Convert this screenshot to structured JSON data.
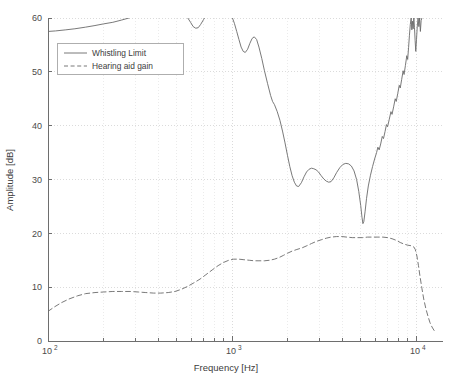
{
  "chart_data": {
    "type": "line",
    "title": "",
    "xlabel": "Frequency [Hz]",
    "ylabel": "Amplitude [dB]",
    "xscale": "log",
    "yscale": "linear",
    "xlim": [
      100,
      14000
    ],
    "ylim": [
      0,
      60
    ],
    "grid": true,
    "legend_position": "upper-left",
    "xticks": [
      100,
      1000,
      10000
    ],
    "xtick_labels": [
      "10^2",
      "10^3",
      "10^4"
    ],
    "xtick_mantissa": [
      "10",
      "10",
      "10"
    ],
    "xtick_exponent": [
      "2",
      "3",
      "4"
    ],
    "yticks": [
      0,
      10,
      20,
      30,
      40,
      50,
      60
    ],
    "ytick_labels": [
      "0",
      "10",
      "20",
      "30",
      "40",
      "50",
      "60"
    ],
    "series": [
      {
        "name": "Whistling Limit",
        "style": "solid",
        "color": "#6a6a6a",
        "points": [
          [
            100,
            57.5
          ],
          [
            110,
            57.6
          ],
          [
            125,
            57.8
          ],
          [
            140,
            58.0
          ],
          [
            160,
            58.3
          ],
          [
            180,
            58.6
          ],
          [
            200,
            58.9
          ],
          [
            225,
            59.2
          ],
          [
            250,
            59.6
          ],
          [
            275,
            60.0
          ],
          [
            300,
            60.6
          ],
          [
            340,
            61.5
          ],
          [
            380,
            62.3
          ],
          [
            420,
            62.8
          ],
          [
            460,
            62.9
          ],
          [
            500,
            62.4
          ],
          [
            540,
            61.2
          ],
          [
            570,
            60.2
          ],
          [
            595,
            59.2
          ],
          [
            615,
            58.4
          ],
          [
            635,
            58.1
          ],
          [
            655,
            58.2
          ],
          [
            675,
            58.8
          ],
          [
            700,
            59.7
          ],
          [
            730,
            60.8
          ],
          [
            780,
            62.2
          ],
          [
            840,
            63.0
          ],
          [
            900,
            62.6
          ],
          [
            950,
            61.4
          ],
          [
            1000,
            60.2
          ],
          [
            1030,
            59.0
          ],
          [
            1060,
            57.5
          ],
          [
            1090,
            56.0
          ],
          [
            1120,
            54.6
          ],
          [
            1150,
            53.8
          ],
          [
            1180,
            53.6
          ],
          [
            1215,
            54.2
          ],
          [
            1250,
            55.3
          ],
          [
            1285,
            56.2
          ],
          [
            1320,
            56.5
          ],
          [
            1360,
            56.0
          ],
          [
            1400,
            54.6
          ],
          [
            1450,
            52.5
          ],
          [
            1500,
            50.2
          ],
          [
            1560,
            47.8
          ],
          [
            1620,
            45.6
          ],
          [
            1660,
            44.5
          ],
          [
            1700,
            43.9
          ],
          [
            1760,
            42.6
          ],
          [
            1820,
            41.0
          ],
          [
            1880,
            39.0
          ],
          [
            1940,
            36.8
          ],
          [
            2000,
            34.5
          ],
          [
            2060,
            32.4
          ],
          [
            2120,
            30.7
          ],
          [
            2180,
            29.5
          ],
          [
            2240,
            28.8
          ],
          [
            2300,
            28.7
          ],
          [
            2380,
            29.4
          ],
          [
            2460,
            30.5
          ],
          [
            2540,
            31.4
          ],
          [
            2620,
            31.9
          ],
          [
            2700,
            32.1
          ],
          [
            2780,
            32.0
          ],
          [
            2860,
            31.8
          ],
          [
            2950,
            31.4
          ],
          [
            3050,
            30.7
          ],
          [
            3150,
            30.1
          ],
          [
            3250,
            29.7
          ],
          [
            3350,
            29.5
          ],
          [
            3450,
            29.6
          ],
          [
            3570,
            30.3
          ],
          [
            3700,
            31.3
          ],
          [
            3850,
            32.2
          ],
          [
            4000,
            32.8
          ],
          [
            4150,
            33.0
          ],
          [
            4300,
            32.9
          ],
          [
            4450,
            32.5
          ],
          [
            4600,
            31.6
          ],
          [
            4750,
            30.0
          ],
          [
            4880,
            27.8
          ],
          [
            5000,
            25.2
          ],
          [
            5080,
            23.0
          ],
          [
            5140,
            21.8
          ],
          [
            5200,
            22.2
          ],
          [
            5280,
            24.0
          ],
          [
            5380,
            26.5
          ],
          [
            5500,
            28.8
          ],
          [
            5650,
            30.8
          ],
          [
            5800,
            32.4
          ],
          [
            5950,
            33.8
          ],
          [
            6100,
            35.0
          ],
          [
            6200,
            36.0
          ],
          [
            6300,
            35.5
          ],
          [
            6420,
            36.6
          ],
          [
            6550,
            38.0
          ],
          [
            6650,
            37.6
          ],
          [
            6780,
            38.9
          ],
          [
            6900,
            40.2
          ],
          [
            7000,
            39.8
          ],
          [
            7150,
            41.2
          ],
          [
            7300,
            42.6
          ],
          [
            7400,
            42.1
          ],
          [
            7550,
            43.5
          ],
          [
            7700,
            45.0
          ],
          [
            7800,
            44.5
          ],
          [
            7950,
            46.0
          ],
          [
            8100,
            47.5
          ],
          [
            8200,
            47.0
          ],
          [
            8350,
            48.6
          ],
          [
            8500,
            50.2
          ],
          [
            8600,
            49.5
          ],
          [
            8750,
            51.2
          ],
          [
            8900,
            53.0
          ],
          [
            9000,
            52.3
          ],
          [
            9100,
            54.5
          ],
          [
            9200,
            56.8
          ],
          [
            9300,
            58.8
          ],
          [
            9400,
            60.0
          ],
          [
            9480,
            57.8
          ],
          [
            9560,
            59.4
          ],
          [
            9640,
            58.0
          ],
          [
            9720,
            60.0
          ],
          [
            9800,
            58.2
          ],
          [
            9880,
            55.8
          ],
          [
            9960,
            53.8
          ],
          [
            10050,
            56.0
          ],
          [
            10150,
            58.5
          ],
          [
            10250,
            60.0
          ],
          [
            10350,
            58.4
          ],
          [
            10450,
            60.0
          ],
          [
            10550,
            57.5
          ],
          [
            10650,
            59.5
          ],
          [
            10750,
            60.0
          ]
        ]
      },
      {
        "name": "Hearing aid gain",
        "style": "dashed",
        "color": "#8a8a8a",
        "points": [
          [
            100,
            5.5
          ],
          [
            108,
            6.3
          ],
          [
            118,
            7.1
          ],
          [
            130,
            7.8
          ],
          [
            145,
            8.4
          ],
          [
            160,
            8.8
          ],
          [
            180,
            9.0
          ],
          [
            200,
            9.1
          ],
          [
            225,
            9.2
          ],
          [
            250,
            9.2
          ],
          [
            280,
            9.2
          ],
          [
            310,
            9.1
          ],
          [
            340,
            9.0
          ],
          [
            375,
            8.9
          ],
          [
            410,
            8.9
          ],
          [
            450,
            9.0
          ],
          [
            490,
            9.2
          ],
          [
            530,
            9.6
          ],
          [
            570,
            10.1
          ],
          [
            620,
            10.8
          ],
          [
            670,
            11.5
          ],
          [
            720,
            12.3
          ],
          [
            780,
            13.2
          ],
          [
            840,
            14.0
          ],
          [
            900,
            14.6
          ],
          [
            960,
            15.0
          ],
          [
            1020,
            15.2
          ],
          [
            1090,
            15.2
          ],
          [
            1160,
            15.1
          ],
          [
            1240,
            15.0
          ],
          [
            1320,
            14.9
          ],
          [
            1400,
            14.9
          ],
          [
            1500,
            14.9
          ],
          [
            1600,
            15.0
          ],
          [
            1700,
            15.2
          ],
          [
            1800,
            15.5
          ],
          [
            1900,
            15.9
          ],
          [
            2000,
            16.3
          ],
          [
            2120,
            16.7
          ],
          [
            2250,
            17.0
          ],
          [
            2400,
            17.3
          ],
          [
            2550,
            17.7
          ],
          [
            2700,
            18.1
          ],
          [
            2870,
            18.5
          ],
          [
            3050,
            18.8
          ],
          [
            3250,
            19.1
          ],
          [
            3450,
            19.3
          ],
          [
            3700,
            19.4
          ],
          [
            3950,
            19.4
          ],
          [
            4200,
            19.3
          ],
          [
            4500,
            19.2
          ],
          [
            4800,
            19.2
          ],
          [
            5100,
            19.2
          ],
          [
            5450,
            19.3
          ],
          [
            5800,
            19.3
          ],
          [
            6200,
            19.3
          ],
          [
            6600,
            19.3
          ],
          [
            7000,
            19.2
          ],
          [
            7400,
            19.0
          ],
          [
            7800,
            18.7
          ],
          [
            8200,
            18.3
          ],
          [
            8600,
            18.0
          ],
          [
            9000,
            17.8
          ],
          [
            9400,
            17.7
          ],
          [
            9700,
            17.5
          ],
          [
            9900,
            17.0
          ],
          [
            10100,
            15.8
          ],
          [
            10300,
            14.0
          ],
          [
            10500,
            12.0
          ],
          [
            10750,
            9.8
          ],
          [
            11000,
            7.8
          ],
          [
            11300,
            6.0
          ],
          [
            11600,
            4.6
          ],
          [
            11900,
            3.4
          ],
          [
            12200,
            2.6
          ],
          [
            12500,
            2.0
          ],
          [
            12800,
            1.6
          ]
        ]
      }
    ]
  },
  "legend": {
    "entries": [
      {
        "label": "Whistling Limit",
        "style": "solid"
      },
      {
        "label": "Hearing aid gain",
        "style": "dashed"
      }
    ]
  },
  "colors": {
    "background": "#ffffff",
    "axis": "#6e6e6e",
    "grid_major": "#d2d2d2",
    "grid_minor": "#e2e2e2",
    "curve": "#6a6a6a",
    "text": "#3c3c3c"
  }
}
